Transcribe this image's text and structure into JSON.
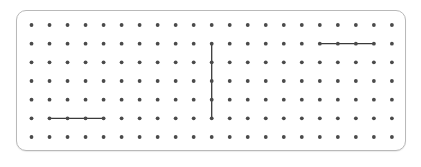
{
  "geoboard": {
    "columns": 21,
    "rows": 7,
    "origin_x": 31.5,
    "origin_y": 25,
    "spacing_x": 18.02,
    "spacing_y": 18.67,
    "dot_color": "#4a4a4a",
    "dot_radius": 1.9,
    "line_color": "#3a3a3a",
    "line_width": 1.3,
    "border_color": "#b9b9b9"
  },
  "segments": [
    {
      "name": "horizontal-segment-top-right",
      "from": [
        16,
        1
      ],
      "to": [
        19,
        1
      ]
    },
    {
      "name": "vertical-segment-middle",
      "from": [
        10,
        1
      ],
      "to": [
        10,
        5
      ]
    },
    {
      "name": "horizontal-segment-bottom-left",
      "from": [
        1,
        5
      ],
      "to": [
        4,
        5
      ]
    }
  ]
}
